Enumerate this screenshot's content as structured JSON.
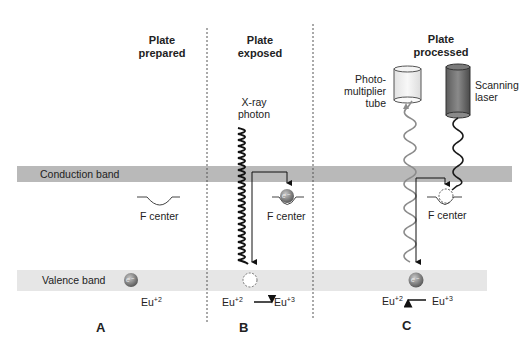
{
  "stages": [
    {
      "title_line1": "Plate",
      "title_line2": "prepared",
      "panel": "A"
    },
    {
      "title_line1": "Plate",
      "title_line2": "exposed",
      "panel": "B"
    },
    {
      "title_line1": "Plate",
      "title_line2": "processed",
      "panel": "C"
    }
  ],
  "bands": {
    "conduction": "Conduction band",
    "valence": "Valence band"
  },
  "labels": {
    "f_center": "F center",
    "xray_line1": "X-ray",
    "xray_line2": "photon",
    "pmt_line1": "Photo-",
    "pmt_line2": "multiplier",
    "pmt_line3": "tube",
    "laser_line1": "Scanning",
    "laser_line2": "laser",
    "electron": "e⁻",
    "eu": "Eu",
    "eu2_sup": "+2",
    "eu3_sup": "+3"
  },
  "colors": {
    "conduction_band": "#b9b9b9",
    "valence_band": "#e6e6e6",
    "electron": "#7a7a7a",
    "pmt_wave": "#8c8c8c",
    "laser_wave": "#1a1a1a",
    "laser_body": "#6e6e6e",
    "pmt_body": "#efefef"
  }
}
